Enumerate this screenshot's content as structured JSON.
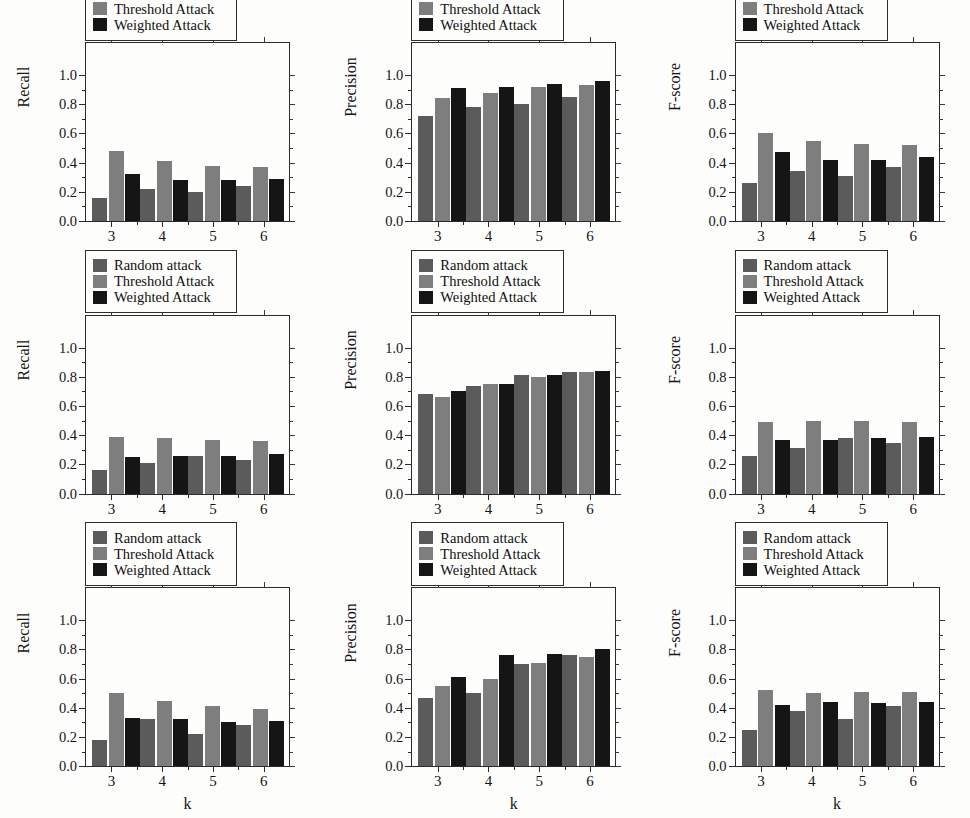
{
  "figure": {
    "background_color": "#fdfdfb",
    "rows": 3,
    "cols": 3
  },
  "series_colors": {
    "random_attack": "#5b5b5b",
    "threshold_attack": "#7e7e7e",
    "weighted_attack": "#151515"
  },
  "legend": {
    "items": [
      {
        "label": "Random attack",
        "key": "random_attack",
        "color": "#5b5b5b"
      },
      {
        "label": "Threshold Attack",
        "key": "threshold_attack",
        "color": "#7e7e7e"
      },
      {
        "label": "Weighted Attack",
        "key": "weighted_attack",
        "color": "#151515"
      }
    ]
  },
  "axis": {
    "xlabel": "k",
    "xticks": [
      "3",
      "4",
      "5",
      "6"
    ],
    "yticks": [
      "0.0",
      "0.2",
      "0.4",
      "0.6",
      "0.8",
      "1.0"
    ],
    "ylim": [
      0.0,
      1.0
    ],
    "ylabels": {
      "recall": "Recall",
      "precision": "Precision",
      "fscore": "F-score"
    }
  },
  "titles": {
    "row1": "AOL",
    "row2": "I2B2",
    "row3": "GoArticle"
  },
  "chart_data": [
    {
      "id": "aol-recall",
      "type": "bar",
      "title": "AOL",
      "xlabel": "k",
      "ylabel": "Recall",
      "categories": [
        "3",
        "4",
        "5",
        "6"
      ],
      "ylim": [
        0.0,
        1.0
      ],
      "grid": false,
      "legend_position": "upper-left",
      "series": [
        {
          "name": "Random attack",
          "values": [
            0.16,
            0.22,
            0.2,
            0.24
          ]
        },
        {
          "name": "Threshold Attack",
          "values": [
            0.48,
            0.41,
            0.38,
            0.37
          ]
        },
        {
          "name": "Weighted Attack",
          "values": [
            0.32,
            0.28,
            0.28,
            0.29
          ]
        }
      ]
    },
    {
      "id": "aol-precision",
      "type": "bar",
      "title": "AOL",
      "xlabel": "k",
      "ylabel": "Precision",
      "categories": [
        "3",
        "4",
        "5",
        "6"
      ],
      "ylim": [
        0.0,
        1.0
      ],
      "grid": false,
      "legend_position": "upper-left",
      "series": [
        {
          "name": "Random attack",
          "values": [
            0.72,
            0.78,
            0.8,
            0.85
          ]
        },
        {
          "name": "Threshold Attack",
          "values": [
            0.84,
            0.88,
            0.92,
            0.93
          ]
        },
        {
          "name": "Weighted Attack",
          "values": [
            0.91,
            0.92,
            0.94,
            0.96
          ]
        }
      ]
    },
    {
      "id": "aol-fscore",
      "type": "bar",
      "title": "AOL",
      "xlabel": "k",
      "ylabel": "F-score",
      "categories": [
        "3",
        "4",
        "5",
        "6"
      ],
      "ylim": [
        0.0,
        1.0
      ],
      "grid": false,
      "legend_position": "upper-left",
      "series": [
        {
          "name": "Random attack",
          "values": [
            0.26,
            0.34,
            0.31,
            0.37
          ]
        },
        {
          "name": "Threshold Attack",
          "values": [
            0.6,
            0.55,
            0.53,
            0.52
          ]
        },
        {
          "name": "Weighted Attack",
          "values": [
            0.47,
            0.42,
            0.42,
            0.44
          ]
        }
      ]
    },
    {
      "id": "i2b2-recall",
      "type": "bar",
      "title": "I2B2",
      "xlabel": "k",
      "ylabel": "Recall",
      "categories": [
        "3",
        "4",
        "5",
        "6"
      ],
      "ylim": [
        0.0,
        1.0
      ],
      "grid": false,
      "legend_position": "upper-left",
      "series": [
        {
          "name": "Random attack",
          "values": [
            0.16,
            0.21,
            0.26,
            0.23
          ]
        },
        {
          "name": "Threshold Attack",
          "values": [
            0.39,
            0.38,
            0.37,
            0.36
          ]
        },
        {
          "name": "Weighted Attack",
          "values": [
            0.25,
            0.26,
            0.26,
            0.27
          ]
        }
      ]
    },
    {
      "id": "i2b2-precision",
      "type": "bar",
      "title": "I2B2",
      "xlabel": "k",
      "ylabel": "Precision",
      "categories": [
        "3",
        "4",
        "5",
        "6"
      ],
      "ylim": [
        0.0,
        1.0
      ],
      "grid": false,
      "legend_position": "upper-left",
      "series": [
        {
          "name": "Random attack",
          "values": [
            0.68,
            0.74,
            0.81,
            0.83
          ]
        },
        {
          "name": "Threshold Attack",
          "values": [
            0.66,
            0.75,
            0.8,
            0.83
          ]
        },
        {
          "name": "Weighted Attack",
          "values": [
            0.7,
            0.75,
            0.81,
            0.84
          ]
        }
      ]
    },
    {
      "id": "i2b2-fscore",
      "type": "bar",
      "title": "I2B2",
      "xlabel": "k",
      "ylabel": "F-score",
      "categories": [
        "3",
        "4",
        "5",
        "6"
      ],
      "ylim": [
        0.0,
        1.0
      ],
      "grid": false,
      "legend_position": "upper-left",
      "series": [
        {
          "name": "Random attack",
          "values": [
            0.26,
            0.31,
            0.38,
            0.35
          ]
        },
        {
          "name": "Threshold Attack",
          "values": [
            0.49,
            0.5,
            0.5,
            0.49
          ]
        },
        {
          "name": "Weighted Attack",
          "values": [
            0.37,
            0.37,
            0.38,
            0.39
          ]
        }
      ]
    },
    {
      "id": "goarticle-recall",
      "type": "bar",
      "title": "GoArticle",
      "xlabel": "k",
      "ylabel": "Recall",
      "categories": [
        "3",
        "4",
        "5",
        "6"
      ],
      "ylim": [
        0.0,
        1.0
      ],
      "grid": false,
      "legend_position": "upper-left",
      "series": [
        {
          "name": "Random attack",
          "values": [
            0.18,
            0.32,
            0.22,
            0.28
          ]
        },
        {
          "name": "Threshold Attack",
          "values": [
            0.5,
            0.45,
            0.41,
            0.39
          ]
        },
        {
          "name": "Weighted Attack",
          "values": [
            0.33,
            0.32,
            0.3,
            0.31
          ]
        }
      ]
    },
    {
      "id": "goarticle-precision",
      "type": "bar",
      "title": "GoArticle",
      "xlabel": "k",
      "ylabel": "Precision",
      "categories": [
        "3",
        "4",
        "5",
        "6"
      ],
      "ylim": [
        0.0,
        1.0
      ],
      "grid": false,
      "legend_position": "upper-left",
      "series": [
        {
          "name": "Random attack",
          "values": [
            0.47,
            0.5,
            0.7,
            0.76
          ]
        },
        {
          "name": "Threshold Attack",
          "values": [
            0.55,
            0.6,
            0.71,
            0.75
          ]
        },
        {
          "name": "Weighted Attack",
          "values": [
            0.61,
            0.76,
            0.77,
            0.8
          ]
        }
      ]
    },
    {
      "id": "goarticle-fscore",
      "type": "bar",
      "title": "GoArticle",
      "xlabel": "k",
      "ylabel": "F-score",
      "categories": [
        "3",
        "4",
        "5",
        "6"
      ],
      "ylim": [
        0.0,
        1.0
      ],
      "grid": false,
      "legend_position": "upper-left",
      "series": [
        {
          "name": "Random attack",
          "values": [
            0.25,
            0.38,
            0.32,
            0.41
          ]
        },
        {
          "name": "Threshold Attack",
          "values": [
            0.52,
            0.5,
            0.51,
            0.51
          ]
        },
        {
          "name": "Weighted Attack",
          "values": [
            0.42,
            0.44,
            0.43,
            0.44
          ]
        }
      ]
    }
  ]
}
